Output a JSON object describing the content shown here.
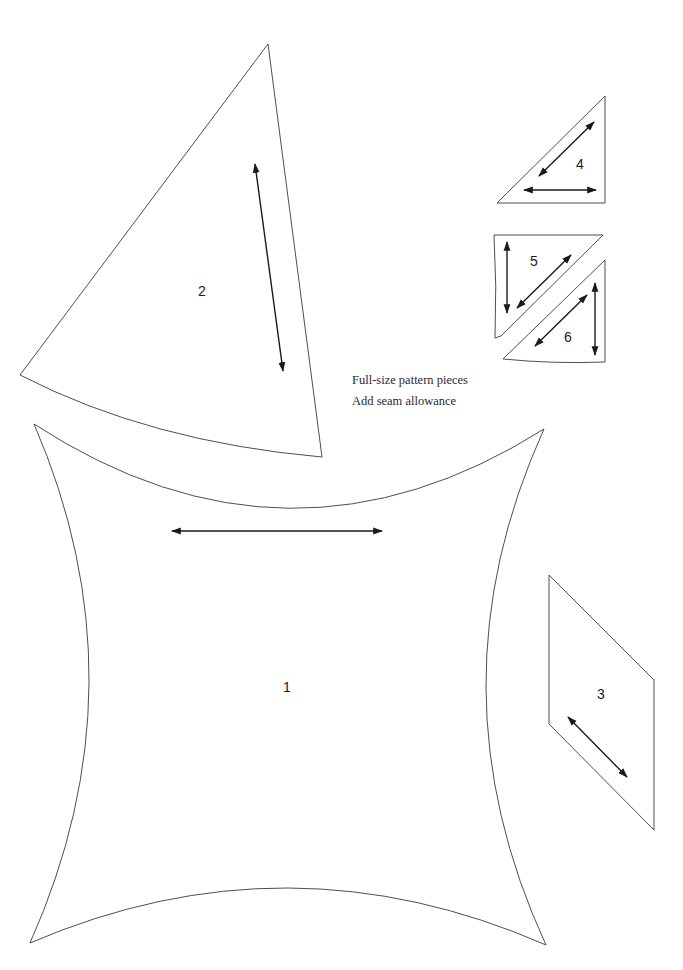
{
  "page": {
    "notes": {
      "line1": "Full-size pattern pieces",
      "line2": "Add seam allowance"
    },
    "colors": {
      "background": "#ffffff",
      "outline": "#3a3a3a",
      "grainline": "#1a1a1a"
    }
  },
  "pieces": [
    {
      "id": "1",
      "label": "1",
      "shape": "concave square (four curved sides)",
      "grainline": "horizontal"
    },
    {
      "id": "2",
      "label": "2",
      "shape": "curved-base triangle / wedge",
      "grainline": "near-vertical"
    },
    {
      "id": "3",
      "label": "3",
      "shape": "parallelogram",
      "grainline": "diagonal"
    },
    {
      "id": "4",
      "label": "4",
      "shape": "right triangle",
      "grainline": "diagonal and horizontal"
    },
    {
      "id": "5",
      "label": "5",
      "shape": "trapezoid with curved left edge",
      "grainline": "vertical and diagonal"
    },
    {
      "id": "6",
      "label": "6",
      "shape": "right triangle with curved base",
      "grainline": "vertical and diagonal"
    }
  ]
}
